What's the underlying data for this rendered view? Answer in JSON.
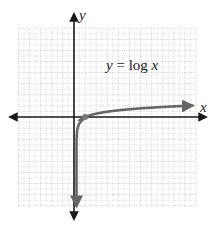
{
  "chart_data": {
    "type": "line",
    "title": "",
    "annotation": "y = log x",
    "xlabel": "x",
    "ylabel": "y",
    "xlim": [
      -5,
      11
    ],
    "ylim": [
      -8,
      8
    ],
    "grid": true,
    "grid_step": 1,
    "legend": null,
    "series": [
      {
        "name": "y = log x",
        "function": "log10",
        "x": [
          0.0001,
          0.001,
          0.01,
          0.1,
          0.5,
          1,
          2,
          4,
          6,
          8,
          10,
          11
        ],
        "values": [
          -4,
          -3,
          -2,
          -1,
          -0.301,
          0,
          0.301,
          0.602,
          0.778,
          0.903,
          1,
          1.041
        ],
        "marked_point": [
          1,
          0
        ]
      }
    ],
    "colors": {
      "axis": "#1a1a1a",
      "curve": "#666666",
      "grid": "#c8c8c8"
    }
  },
  "labels": {
    "x_axis": "x",
    "y_axis": "y",
    "function_lhs": "y",
    "function_eq": " = ",
    "function_log": "log ",
    "function_arg": "x"
  }
}
